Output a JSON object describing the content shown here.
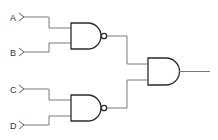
{
  "diagram": {
    "type": "logic-circuit",
    "inputs": [
      {
        "label": "A"
      },
      {
        "label": "B"
      },
      {
        "label": "C"
      },
      {
        "label": "D"
      }
    ],
    "gates": [
      {
        "id": "nand1",
        "type": "NAND",
        "inputs": [
          "A",
          "B"
        ]
      },
      {
        "id": "nand2",
        "type": "NAND",
        "inputs": [
          "C",
          "D"
        ]
      },
      {
        "id": "and1",
        "type": "AND",
        "inputs": [
          "nand1",
          "nand2"
        ]
      }
    ],
    "output": {
      "from": "and1"
    },
    "colors": {
      "wire": "#7a7a7a",
      "gate": "#2a2a2a",
      "background": "#ffffff"
    }
  }
}
